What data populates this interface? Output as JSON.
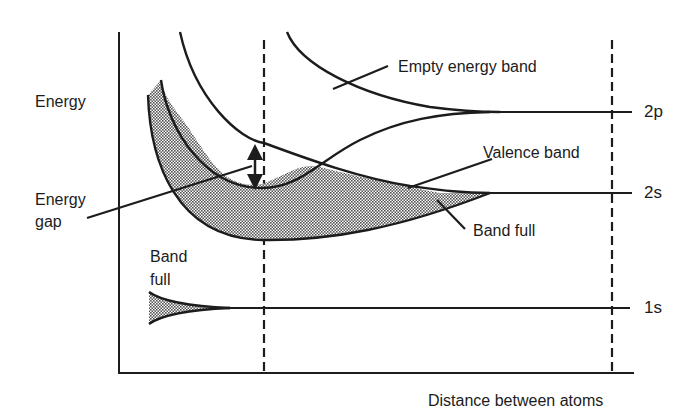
{
  "diagram": {
    "axes": {
      "y_label": "Energy",
      "x_label": "Distance between atoms"
    },
    "levels": [
      {
        "id": "2p",
        "label": "2p"
      },
      {
        "id": "2s",
        "label": "2s"
      },
      {
        "id": "1s",
        "label": "1s"
      }
    ],
    "annotations": {
      "empty_band": "Empty energy band",
      "valence_band": "Valence band",
      "band_full_right": "Band full",
      "band_full_left_line1": "Band",
      "band_full_left_line2": "full",
      "energy_gap_line1": "Energy",
      "energy_gap_line2": "gap"
    },
    "colors": {
      "ink": "#1c1c1c",
      "background": "#ffffff",
      "shade": "#9a9a9a"
    }
  }
}
